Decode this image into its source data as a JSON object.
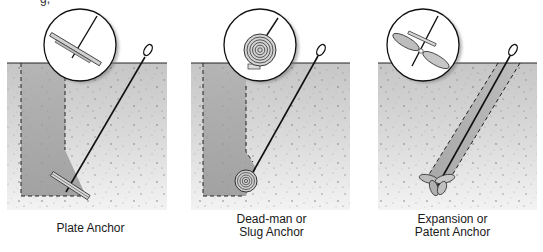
{
  "figure": {
    "clipped_text_top_left": "g,",
    "colors": {
      "soil_top": "#c9c9c9",
      "soil_bottom": "#f2f2f2",
      "excavation": "#a9a9a9",
      "line": "#111111",
      "inset_bg": "#ffffff"
    },
    "panels": [
      {
        "id": "plate",
        "caption_lines": [
          "Plate Anchor"
        ],
        "anchor_shape": "plate",
        "inset_icon": "plate-anchor-icon"
      },
      {
        "id": "deadman",
        "caption_lines": [
          "Dead-man or",
          "Slug Anchor"
        ],
        "anchor_shape": "concentric-disc",
        "inset_icon": "slug-anchor-icon"
      },
      {
        "id": "expansion",
        "caption_lines": [
          "Expansion or",
          "Patent Anchor"
        ],
        "anchor_shape": "propeller-blades",
        "inset_icon": "expansion-anchor-icon"
      }
    ]
  }
}
